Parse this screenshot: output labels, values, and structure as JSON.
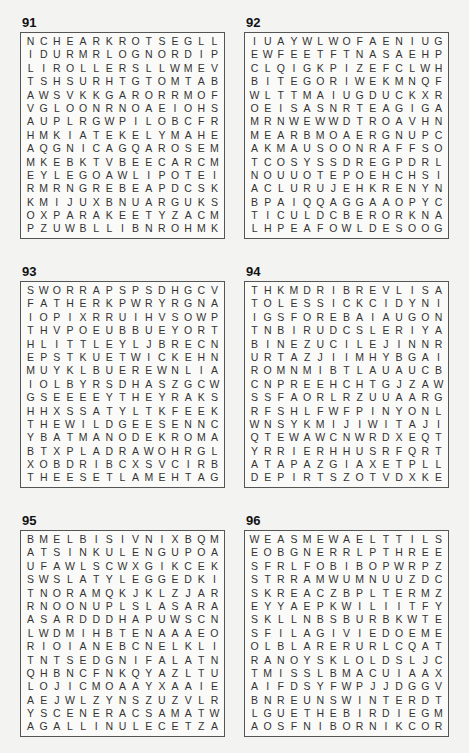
{
  "puzzles": [
    {
      "number": "91",
      "rows": [
        "NCHEARKROTSEGLL",
        "IDURMRLOGNORDIP",
        "LIROLLERSLLWMEV",
        "TSHSURHTGTOMTAB",
        "AWSVKKGARORRMOF",
        "VGLOONRNOAEIOHS",
        "AUPLRGWPILOBCFR",
        "HMKIATEKELYMAHE",
        "AQGNICAGQAROSEM",
        "MKEBKTVBEECARCM",
        "EYLEGOAWLIPOTEI",
        "RMRNGREBEAPDCSK",
        "KMIJUXBNUARGUKS",
        "OXPARAKEETYZACM",
        "PZUWBLLIBNROHMK"
      ]
    },
    {
      "number": "92",
      "rows": [
        "IUAYWLWOFAENIUG",
        "EWFEETFTNASAEHP",
        "CLQIGKPIZEFCLWH",
        "BITEGORIWEKMNQF",
        "WLTTMAIUGDUCKXR",
        "OEISASNRTEAGIGA",
        "MRNWEWWDTROAVHN",
        "MEARBMOAERGNUPC",
        "AKMAUSOONRAFFSO",
        "TCOSYSSDREGPDRL",
        "NOUUOTEPOEHCHSI",
        "ACLURUJEHKRENYN",
        "BPAIQQAGGAAOPYC",
        "TICULDCBERORKNA",
        "LHPEAFOWLDESOOG"
      ]
    },
    {
      "number": "93",
      "rows": [
        "SWORRAPSPSDHGCV",
        "FATHERKPWRYRGNA",
        "IOPIXRRUIHVSOWP",
        "THVPOEUBBUEYORT",
        "HLITTLEYLJBRECN",
        "EPSTKUETWICKEHN",
        "MUYKLBUEREWNLIA",
        "IOLBYRSDHASZGCW",
        "GSEEEEYTHEYRAKS",
        "HHXSSATYLTKFEEK",
        "THEWILDGEESENNC",
        "YBATMANODEKROMA",
        "BTXPLADRAWOHRGL",
        "XOBDRIBCXSVCIRB",
        "THEESETLAMEHTAG"
      ]
    },
    {
      "number": "94",
      "rows": [
        "THKMDRIBREVLISA",
        "TOLESSICKCIDYNI",
        "IGSFOREBAIAUGON",
        "TNBIRUDCSLERIYA",
        "BINEZUCILEJINNR",
        "URTAZJIIMHYBGAI",
        "ROMNMIBTLAUAUCB",
        "CNPREEHCHTGJZAW",
        "SSFAORLRZUUAARG",
        "RFSHLFWFPINYONL",
        "WNSYKMIJIWITAJI",
        "QTEWAWCNWRDXEQT",
        "YRRIERHHUSRFQRT",
        "ATAPAZGIAXETPLL",
        "DEPIRTSZOTVDXKE"
      ]
    },
    {
      "number": "95",
      "rows": [
        "BMELBISIVNIXBQM",
        "ATSINKULENGUPOA",
        "UFAWLSCWXGIKCEK",
        "SWSLATYLEGGEDKI",
        "TNORAMQKJKLZJAR",
        "RNOONUPLSLASARA",
        "ASARDDDHAPUWSCN",
        "LWDMIHBTENAAAEO",
        "RIOIANEBCNELKLI",
        "TNTSEDGNIFALATN",
        "QHBNCFNKQYAZLTU",
        "LOJICMOAAYXAAIE",
        "AEJWLZYNSZUZVLR",
        "YSCENERACSAMATW",
        "AGALLINULECETZA"
      ]
    },
    {
      "number": "96",
      "rows": [
        "WEASMEWAELTTILS",
        "EOBGNERRLPTHREE",
        "SFRLFOBIBOPWRPZ",
        "STRRAMWUMNUUZDC",
        "SKREACZBPLTERMZ",
        "EYYAEPKWILIITFY",
        "SKLLNBSBURBKWTE",
        "SFILAGIVIEDOEME",
        "OLBLARERURLCQAT",
        "RANOYSKLOLDSLJC",
        "TMISSLBMACUIAAX",
        "AIFDSYFWPJJDGGV",
        "BNREUNSWINTERDT",
        "LGUETHEBIRDIEGM",
        "AOSFNIBORNIKCOR"
      ]
    }
  ]
}
